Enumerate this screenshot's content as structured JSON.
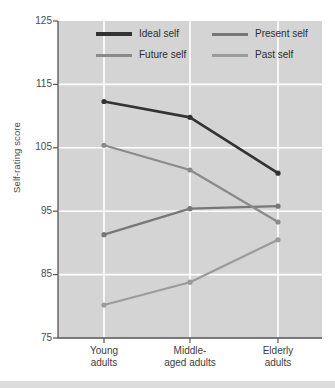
{
  "chart_data": {
    "type": "line",
    "title": "",
    "xlabel": "",
    "ylabel": "Self-rating score",
    "categories": [
      "Young adults",
      "Middle-aged adults",
      "Elderly adults"
    ],
    "category_lines": [
      [
        "Young",
        "adults"
      ],
      [
        "Middle-",
        "aged adults"
      ],
      [
        "Elderly",
        "adults"
      ]
    ],
    "ylim": [
      75,
      125
    ],
    "yticks": [
      125,
      115,
      105,
      95,
      85,
      75
    ],
    "grid": true,
    "legend_position": "top-inside",
    "series": [
      {
        "name": "Ideal self",
        "values": [
          112.3,
          109.8,
          101.0
        ],
        "color": "#333333",
        "markers": true
      },
      {
        "name": "Present self",
        "values": [
          91.3,
          95.4,
          95.8
        ],
        "color": "#777777",
        "markers": true
      },
      {
        "name": "Future self",
        "values": [
          105.4,
          101.5,
          93.3
        ],
        "color": "#8a8a8a",
        "markers": true
      },
      {
        "name": "Past self",
        "values": [
          80.2,
          83.8,
          90.5
        ],
        "color": "#9b9b9b",
        "markers": true
      }
    ]
  },
  "colors": {
    "plot_background": "#d4d4d4",
    "gridline": "#ffffff",
    "axis": "#555555",
    "tick_text": "#4a4a4a",
    "bottom_band": "#dcdcdc",
    "page_background": "#ffffff"
  },
  "legend": {
    "entries": [
      {
        "label": "Ideal self",
        "color": "#333333"
      },
      {
        "label": "Present self",
        "color": "#777777"
      },
      {
        "label": "Future self",
        "color": "#8a8a8a"
      },
      {
        "label": "Past self",
        "color": "#9b9b9b"
      }
    ]
  }
}
